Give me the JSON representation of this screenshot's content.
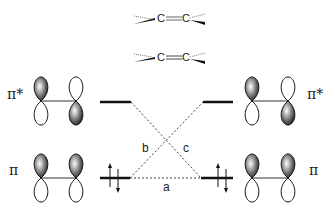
{
  "molecules": {
    "top": {
      "left_atom": "C",
      "right_atom": "C",
      "bond": "double (twisted)"
    },
    "bottom": {
      "left_atom": "C",
      "right_atom": "C",
      "bond": "double (planar)"
    }
  },
  "levels": {
    "left_upper": "π*",
    "left_lower": "π",
    "right_upper": "π*",
    "right_lower": "π"
  },
  "labels": {
    "pi_star_left": "π*",
    "pi_left": "π",
    "pi_star_right": "π*",
    "pi_right": "π",
    "interaction_a": "a",
    "interaction_b": "b",
    "interaction_c": "c"
  },
  "electrons": {
    "left_pi": "↑↓",
    "right_pi": "↑↓"
  },
  "colors": {
    "line": "#111111",
    "dashed": "#444444",
    "lobe_fill": "#333333"
  }
}
